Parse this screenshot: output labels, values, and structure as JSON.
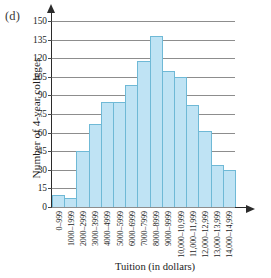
{
  "panel": {
    "letter": "(d)"
  },
  "chart_data": {
    "type": "bar",
    "title": "",
    "xlabel": "Tuition (in dollars)",
    "ylabel": "Number of 4-year colleges",
    "categories": [
      "0–999",
      "1000–1999",
      "2000–2999",
      "3000–3999",
      "4000–4999",
      "5000–5999",
      "6000–6999",
      "7000–7999",
      "8000–8999",
      "9000–9999",
      "10,000–10,999",
      "11,000–11,999",
      "12,000–12,999",
      "13,000–13,999",
      "14,000–14,999"
    ],
    "values": [
      10,
      7,
      45,
      67,
      85,
      85,
      98,
      118,
      138,
      110,
      105,
      82,
      61,
      34,
      30
    ],
    "yticks": [
      0,
      15,
      30,
      45,
      60,
      75,
      90,
      105,
      120,
      135,
      150
    ],
    "ylim": [
      0,
      150
    ],
    "grid": true,
    "legend": "none",
    "colors": {
      "bar_fill": "#bfe3f4",
      "bar_stroke": "#6fb9d6",
      "gridline": "#8d8d8d",
      "axis": "#2b2b2b",
      "text": "#1c1c1c"
    }
  }
}
